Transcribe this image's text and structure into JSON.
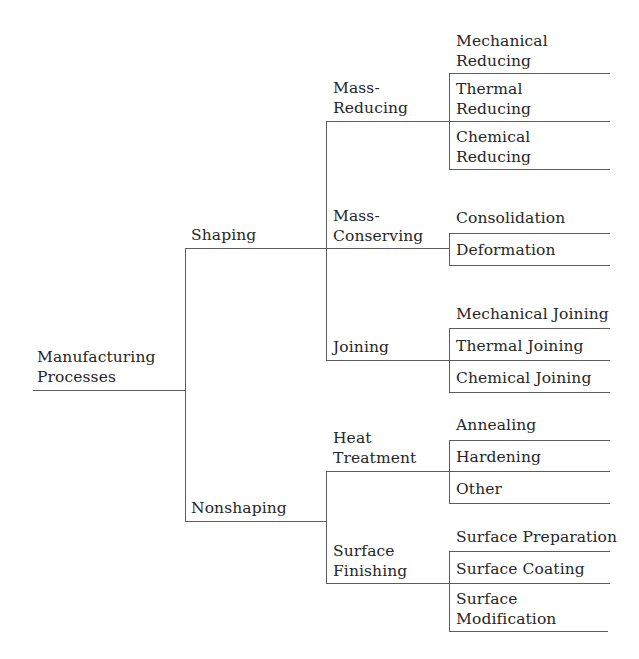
{
  "diagram": {
    "type": "tree",
    "root": "Manufacturing Processes",
    "nodes": {
      "root": {
        "label": "Manufacturing\nProcesses"
      },
      "shaping": {
        "label": "Shaping"
      },
      "nonshaping": {
        "label": "Nonshaping"
      },
      "mass_reducing": {
        "label": "Mass-\nReducing"
      },
      "mass_conserving": {
        "label": "Mass-\nConserving"
      },
      "joining": {
        "label": "Joining"
      },
      "heat_treatment": {
        "label": "Heat\nTreatment"
      },
      "surface_finishing": {
        "label": "Surface\nFinishing"
      },
      "mechanical_reducing": {
        "label": "Mechanical\nReducing"
      },
      "thermal_reducing": {
        "label": "Thermal\nReducing"
      },
      "chemical_reducing": {
        "label": "Chemical\nReducing"
      },
      "consolidation": {
        "label": "Consolidation"
      },
      "deformation": {
        "label": "Deformation"
      },
      "mechanical_joining": {
        "label": "Mechanical Joining"
      },
      "thermal_joining": {
        "label": "Thermal Joining"
      },
      "chemical_joining": {
        "label": "Chemical Joining"
      },
      "annealing": {
        "label": "Annealing"
      },
      "hardening": {
        "label": "Hardening"
      },
      "other": {
        "label": "Other"
      },
      "surface_preparation": {
        "label": "Surface Preparation"
      },
      "surface_coating": {
        "label": "Surface Coating"
      },
      "surface_modification": {
        "label": "Surface\nModification"
      }
    },
    "hierarchy": {
      "Manufacturing Processes": {
        "Shaping": {
          "Mass-Reducing": [
            "Mechanical Reducing",
            "Thermal Reducing",
            "Chemical Reducing"
          ],
          "Mass-Conserving": [
            "Consolidation",
            "Deformation"
          ],
          "Joining": [
            "Mechanical Joining",
            "Thermal Joining",
            "Chemical Joining"
          ]
        },
        "Nonshaping": {
          "Heat Treatment": [
            "Annealing",
            "Hardening",
            "Other"
          ],
          "Surface Finishing": [
            "Surface Preparation",
            "Surface Coating",
            "Surface Modification"
          ]
        }
      }
    },
    "colors": {
      "line": "#5c5c5c",
      "text": "#262626",
      "background": "#ffffff"
    }
  }
}
